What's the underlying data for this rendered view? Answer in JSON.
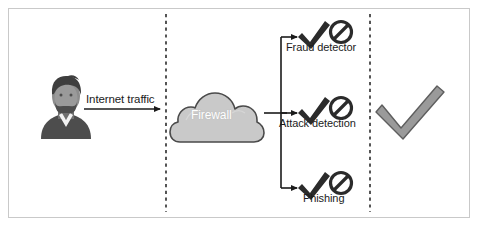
{
  "figure": {
    "width": 479,
    "height": 227,
    "background": "#ffffff",
    "border_color": "#c9c9c9"
  },
  "colors": {
    "line": "#1b1b1b",
    "cloud_fill": "#c9c9c9",
    "cloud_stroke": "#4a4a4a",
    "cloud_text": "#ffffff",
    "person_dark": "#4a4a4a",
    "person_mid": "#707070",
    "person_light": "#8e8e8e",
    "check_small": "#2b2b2b",
    "check_large": "#9a9a9a",
    "check_large_stroke": "#5e5e5e",
    "ban_sign": "#2b2b2b",
    "dashed_divider": "#2b2b2b",
    "text": "#1b1b1b"
  },
  "source": {
    "actor_label": "user-avatar",
    "traffic_label": "Internet traffic"
  },
  "firewall": {
    "label": "Firewall",
    "icon": "cloud-icon"
  },
  "detectors": [
    {
      "id": "fraud-detector",
      "label": "Fraud detector",
      "allow_icon": "check-icon",
      "block_icon": "ban-icon",
      "y": 30
    },
    {
      "id": "attack-detection",
      "label": "Attack detection",
      "allow_icon": "check-icon",
      "block_icon": "ban-icon",
      "y": 106
    },
    {
      "id": "phishing",
      "label": "Phishing",
      "allow_icon": "check-icon",
      "block_icon": "ban-icon",
      "y": 181
    }
  ],
  "outcome": {
    "id": "approved-outcome",
    "icon": "large-check-icon",
    "label": ""
  },
  "dividers": [
    {
      "id": "divider-left",
      "x": 166
    },
    {
      "id": "divider-right",
      "x": 370
    }
  ]
}
